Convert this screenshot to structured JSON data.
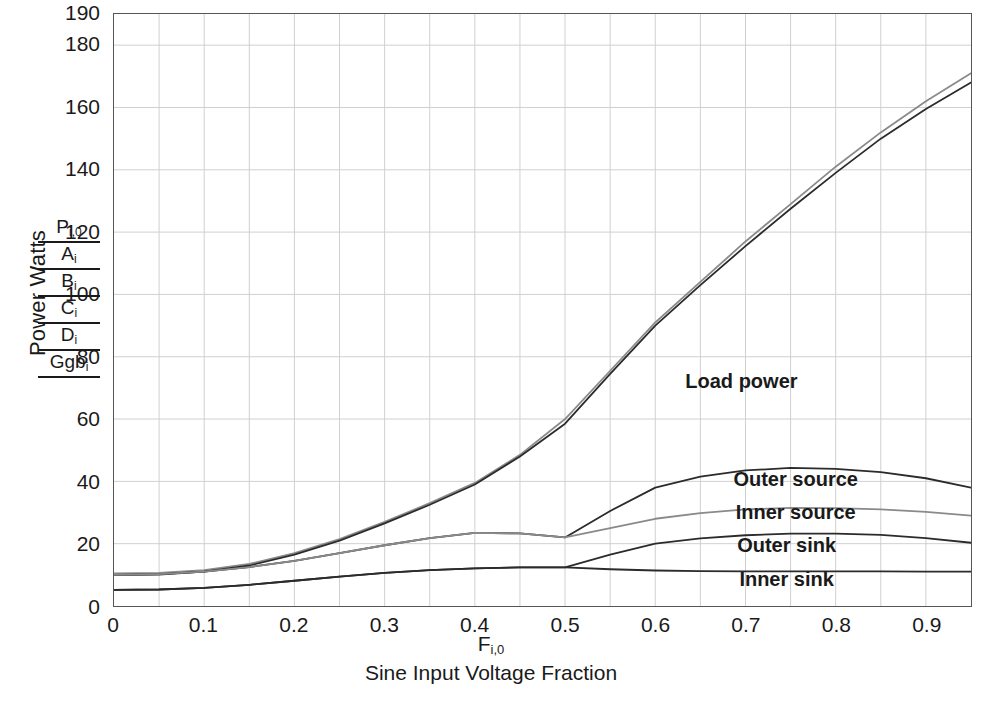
{
  "axes": {
    "ylabel": "Power Watts",
    "xvar": "F",
    "xvar_sub": "i,0",
    "xcaption": "Sine Input Voltage Fraction",
    "yticks": [
      0,
      20,
      40,
      60,
      80,
      100,
      120,
      140,
      160,
      180,
      190
    ],
    "xticks": [
      "0",
      "0.1",
      "0.2",
      "0.3",
      "0.4",
      "0.5",
      "0.6",
      "0.7",
      "0.8",
      "0.9"
    ]
  },
  "trace_key": [
    {
      "base": "P",
      "sub": "i,0"
    },
    {
      "base": "A",
      "sub": "i"
    },
    {
      "base": "B",
      "sub": "i"
    },
    {
      "base": "C",
      "sub": "i"
    },
    {
      "base": "D",
      "sub": "i"
    },
    {
      "base": "Ggb",
      "sub": "i"
    }
  ],
  "annotations": [
    {
      "label": "Load power",
      "x": 0.695,
      "y": 72.0
    },
    {
      "label": "Outer source",
      "x": 0.755,
      "y": 40.5
    },
    {
      "label": "Inner source",
      "x": 0.755,
      "y": 30.0
    },
    {
      "label": "Outer sink",
      "x": 0.745,
      "y": 19.5
    },
    {
      "label": "Inner sink",
      "x": 0.745,
      "y": 8.5
    }
  ],
  "chart_data": {
    "type": "line",
    "title": "",
    "xlabel": "F i,0 — Sine Input Voltage Fraction",
    "ylabel": "Power Watts",
    "xlim": [
      0,
      0.95
    ],
    "ylim": [
      0,
      190
    ],
    "grid": true,
    "grid_x_step": 0.05,
    "grid_y_step": 20,
    "legend": "inline-annotations",
    "x": [
      0,
      0.05,
      0.1,
      0.15,
      0.2,
      0.25,
      0.3,
      0.35,
      0.4,
      0.45,
      0.5,
      0.55,
      0.6,
      0.65,
      0.7,
      0.75,
      0.8,
      0.85,
      0.9,
      0.95
    ],
    "series": [
      {
        "name": "Load power (upper trace)",
        "key": "P_i,0",
        "color": "#8a8a8a",
        "values": [
          10.5,
          10.6,
          11.5,
          13.5,
          17.0,
          21.5,
          27.0,
          33.0,
          39.5,
          48.5,
          60.0,
          75.5,
          91.0,
          104.0,
          117.0,
          129.0,
          141.0,
          152.0,
          162.0,
          171.0
        ]
      },
      {
        "name": "Load power (lower trace)",
        "key": "A_i",
        "color": "#2b2b2b",
        "values": [
          10.0,
          10.1,
          11.0,
          13.0,
          16.5,
          21.0,
          26.5,
          32.5,
          39.0,
          48.0,
          58.5,
          74.5,
          90.0,
          103.0,
          115.5,
          127.5,
          139.0,
          150.0,
          159.5,
          168.0
        ]
      },
      {
        "name": "Outer source",
        "key": "B_i",
        "color": "#2b2b2b",
        "values": [
          10.0,
          10.2,
          11.0,
          12.5,
          14.5,
          17.0,
          19.5,
          21.8,
          23.5,
          23.3,
          22.0,
          30.5,
          38.0,
          41.5,
          43.5,
          44.3,
          44.0,
          43.0,
          41.0,
          38.0
        ]
      },
      {
        "name": "Inner source",
        "key": "C_i",
        "color": "#8a8a8a",
        "values": [
          10.0,
          10.2,
          11.0,
          12.5,
          14.5,
          17.0,
          19.5,
          21.8,
          23.5,
          23.3,
          22.0,
          25.0,
          28.0,
          29.8,
          31.0,
          31.5,
          31.4,
          31.0,
          30.2,
          29.0
        ]
      },
      {
        "name": "Outer sink",
        "key": "D_i",
        "color": "#2b2b2b",
        "values": [
          5.2,
          5.3,
          5.8,
          6.8,
          8.1,
          9.4,
          10.6,
          11.5,
          12.1,
          12.4,
          12.4,
          16.5,
          20.0,
          21.7,
          22.7,
          23.2,
          23.2,
          22.8,
          21.8,
          20.3
        ]
      },
      {
        "name": "Inner sink",
        "key": "Ggb_i",
        "color": "#2b2b2b",
        "values": [
          5.2,
          5.3,
          5.8,
          6.8,
          8.1,
          9.4,
          10.6,
          11.5,
          12.1,
          12.4,
          12.4,
          11.8,
          11.4,
          11.2,
          11.1,
          11.1,
          11.1,
          11.1,
          11.0,
          11.0
        ]
      }
    ]
  }
}
